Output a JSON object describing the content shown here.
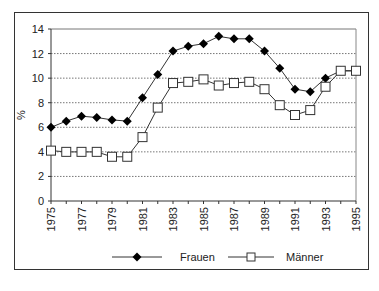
{
  "chart_data": {
    "type": "line",
    "title": "",
    "xlabel": "",
    "ylabel": "%",
    "ylim": [
      0,
      14
    ],
    "yticks": [
      0,
      2,
      4,
      6,
      8,
      10,
      12,
      14
    ],
    "x": [
      1975,
      1976,
      1977,
      1978,
      1979,
      1980,
      1981,
      1982,
      1983,
      1984,
      1985,
      1986,
      1987,
      1988,
      1989,
      1990,
      1991,
      1992,
      1993,
      1994,
      1995
    ],
    "xtick_labels": [
      "1975",
      "1977",
      "1979",
      "1981",
      "1983",
      "1985",
      "1987",
      "1989",
      "1991",
      "1993",
      "1995"
    ],
    "grid": "horizontal dotted",
    "legend_position": "bottom",
    "series": [
      {
        "name": "Frauen",
        "marker": "diamond-filled",
        "color": "#000000",
        "values": [
          6.0,
          6.5,
          6.9,
          6.8,
          6.6,
          6.5,
          8.4,
          10.3,
          12.2,
          12.6,
          12.8,
          13.4,
          13.2,
          13.2,
          12.2,
          10.8,
          9.1,
          8.9,
          10.0,
          10.6,
          10.6
        ]
      },
      {
        "name": "Männer",
        "marker": "square-open",
        "color": "#000000",
        "values": [
          4.1,
          4.0,
          4.0,
          4.0,
          3.6,
          3.6,
          5.2,
          7.6,
          9.6,
          9.7,
          9.9,
          9.4,
          9.6,
          9.7,
          9.1,
          7.8,
          7.0,
          7.4,
          9.3,
          10.6,
          10.6
        ]
      }
    ]
  },
  "legend": {
    "items": [
      {
        "label": "Frauen",
        "marker": "diamond-filled"
      },
      {
        "label": "Männer",
        "marker": "square-open"
      }
    ]
  },
  "axis": {
    "ylabel": "%"
  }
}
